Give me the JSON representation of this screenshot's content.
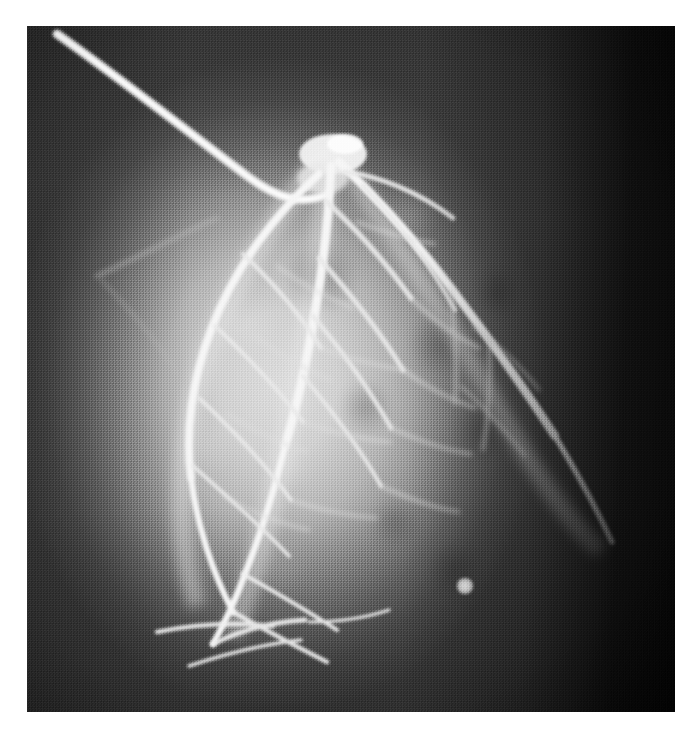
{
  "document": {
    "type": "scanned-radiograph-figure",
    "media": "coronary angiogram (cine X-ray still)",
    "page_background": "#ffffff",
    "ghost_text": "",
    "caption": ""
  },
  "plate": {
    "name": "coronary-angiogram",
    "left": 27,
    "top": 26,
    "width": 648,
    "height": 686,
    "colors": {
      "white_page": "#ffffff",
      "darkest_field": "#080808",
      "dark_field": "#2a2a2a",
      "mid_field": "#4e4e4e",
      "blush_mid": "#8e8e8e",
      "blush_bright": "#cfcfcf",
      "vessel_contrast": "#f2f2f2",
      "catheter": "#ededed"
    },
    "regions": [
      {
        "name": "dark-lateral-margin-right",
        "note": "near-black collimated field, right 14%"
      },
      {
        "name": "dark-band-top",
        "note": "dark lung/mediastinal field above cardiac border"
      },
      {
        "name": "cardiac-silhouette",
        "note": "bright rounded myocardial blush, left-of-centre"
      },
      {
        "name": "bright-focal-spot",
        "note": "small round radiopaque dot, lower right of blush"
      }
    ]
  },
  "anatomy": {
    "catheter": {
      "label": "guiding catheter",
      "entry": "upper-left",
      "path": "descends diagonally to the coronary ostium near top-centre"
    },
    "ostium": {
      "label": "coronary ostium / bifurcation",
      "x": 0.47,
      "y": 0.16
    },
    "vessels": [
      {
        "name": "left-main",
        "label": "left main coronary artery"
      },
      {
        "name": "lad",
        "label": "left anterior descending artery"
      },
      {
        "name": "diagonal-1",
        "label": "first diagonal branch"
      },
      {
        "name": "diagonal-2",
        "label": "second diagonal branch"
      },
      {
        "name": "circumflex",
        "label": "circumflex artery"
      },
      {
        "name": "om-1",
        "label": "first obtuse marginal branch"
      },
      {
        "name": "om-2",
        "label": "second obtuse marginal branch"
      },
      {
        "name": "septal-branches",
        "label": "septal perforator branches"
      },
      {
        "name": "distal-lad",
        "label": "distal LAD wrapping the apex"
      },
      {
        "name": "apical-branches",
        "label": "apical branches"
      }
    ]
  }
}
